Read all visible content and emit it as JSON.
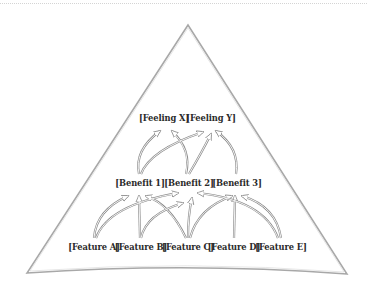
{
  "diagram": {
    "type": "benefit-ladder-pyramid",
    "shape": "triangle",
    "stroke_color": "#9a9a9a",
    "text_color": "#2a2a2a",
    "tiers": {
      "feelings": [
        {
          "label": "[Feeling X]",
          "x": 164,
          "y": 113
        },
        {
          "label": "[Feeling Y]",
          "x": 211,
          "y": 113
        }
      ],
      "benefits": [
        {
          "label": "[Benefit 1]",
          "x": 140,
          "y": 178
        },
        {
          "label": "[Benefit 2]",
          "x": 189,
          "y": 178
        },
        {
          "label": "[Benefit 3]",
          "x": 237,
          "y": 178
        }
      ],
      "features": [
        {
          "label": "[Feature A]",
          "x": 94,
          "y": 242
        },
        {
          "label": "[Feature B]",
          "x": 141,
          "y": 242
        },
        {
          "label": "[Feature C]",
          "x": 188,
          "y": 242
        },
        {
          "label": "[Feature D]",
          "x": 234,
          "y": 242
        },
        {
          "label": "[Feature E]",
          "x": 281,
          "y": 242
        }
      ]
    },
    "connections": [
      {
        "from": "Feature A",
        "to": "Benefit 1"
      },
      {
        "from": "Feature A",
        "to": "Benefit 2"
      },
      {
        "from": "Feature B",
        "to": "Benefit 1"
      },
      {
        "from": "Feature B",
        "to": "Benefit 2"
      },
      {
        "from": "Feature C",
        "to": "Benefit 1"
      },
      {
        "from": "Feature C",
        "to": "Benefit 2"
      },
      {
        "from": "Feature C",
        "to": "Benefit 3"
      },
      {
        "from": "Feature D",
        "to": "Benefit 3"
      },
      {
        "from": "Feature E",
        "to": "Benefit 2"
      },
      {
        "from": "Feature E",
        "to": "Benefit 3"
      },
      {
        "from": "Benefit 1",
        "to": "Feeling X"
      },
      {
        "from": "Benefit 1",
        "to": "Feeling Y"
      },
      {
        "from": "Benefit 2",
        "to": "Feeling X"
      },
      {
        "from": "Benefit 2",
        "to": "Feeling Y"
      },
      {
        "from": "Benefit 3",
        "to": "Feeling Y"
      }
    ]
  }
}
